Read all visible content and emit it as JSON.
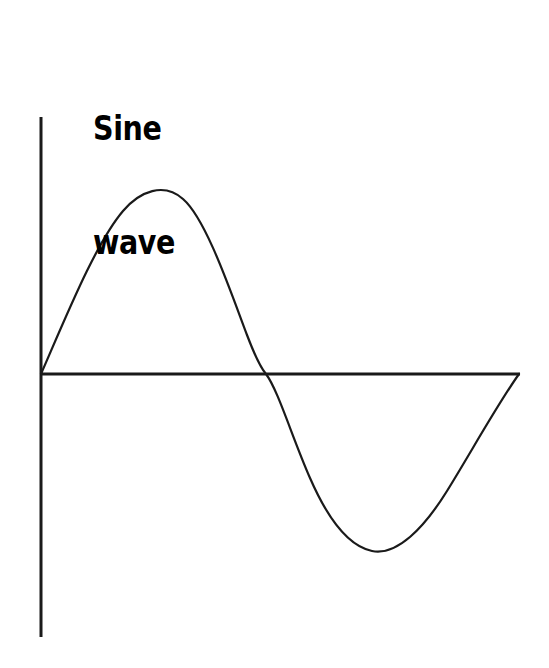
{
  "figure": {
    "width": 549,
    "height": 668,
    "background_color": "#ffffff"
  },
  "title": {
    "line1": "Sine",
    "line2": "wave",
    "full_text": "Sine wave",
    "color": "#000000"
  },
  "axes": {
    "color": "#1a1a1a",
    "stroke_width": 3,
    "y_axis": {
      "x": 41,
      "y_top": 117,
      "y_bottom": 637
    },
    "x_axis": {
      "y": 374,
      "x_left": 41,
      "x_right": 520
    }
  },
  "curve": {
    "color": "#1a1a1a",
    "stroke_width": 2.2,
    "path": "M 41,374 C 68,312 96,243 123,211 C 140,191 164,182 183,199 C 206,219 230,290 247,335 C 255,356 261,368 266,374 C 278,390 292,437 310,478 C 327,517 348,546 372,551 C 397,556 424,528 447,491 C 470,454 497,405 519,374"
  },
  "chart_data": {
    "type": "line",
    "title": "Sine wave",
    "xlabel": "",
    "ylabel": "",
    "grid": false,
    "legend": false,
    "axis_style": "two-axis-cross-at-origin",
    "xlim": [
      0,
      6.6
    ],
    "ylim": [
      -1.15,
      1.35
    ],
    "series": [
      {
        "name": "sine",
        "equation": "y = sin(x)",
        "x": [
          0.0,
          0.26,
          0.52,
          0.79,
          1.05,
          1.31,
          1.57,
          1.83,
          2.09,
          2.36,
          2.62,
          2.88,
          3.14,
          3.4,
          3.67,
          3.93,
          4.19,
          4.45,
          4.71,
          4.97,
          5.24,
          5.5,
          5.76,
          6.02,
          6.28
        ],
        "y": [
          0.0,
          0.26,
          0.5,
          0.71,
          0.87,
          0.97,
          1.0,
          0.97,
          0.87,
          0.71,
          0.5,
          0.26,
          0.0,
          -0.26,
          -0.5,
          -0.71,
          -0.87,
          -0.97,
          -1.0,
          -0.97,
          -0.87,
          -0.71,
          -0.5,
          -0.26,
          0.0
        ]
      }
    ],
    "annotations": {
      "origin_px": [
        41,
        374
      ],
      "peak_px": [
        152,
        186
      ],
      "zero_crossing_px": [
        266,
        374
      ],
      "trough_px": [
        380,
        551
      ],
      "end_px": [
        519,
        374
      ]
    }
  }
}
